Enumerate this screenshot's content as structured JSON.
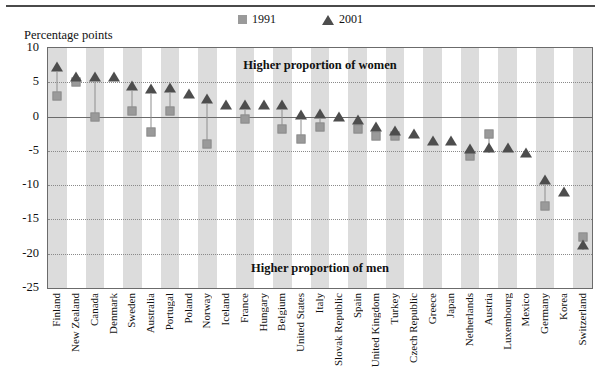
{
  "top_rule": true,
  "axis_title": "Percentage points",
  "legend": [
    {
      "label": "1991",
      "marker": "square-marker",
      "color": "#9a9a9a"
    },
    {
      "label": "2001",
      "marker": "triangle-marker",
      "color": "#4d4d4d"
    }
  ],
  "annotations": {
    "upper": "Higher proportion of women",
    "lower": "Higher proportion of men"
  },
  "chart_data": {
    "type": "scatter",
    "title": "",
    "subtitle": "",
    "xlabel": "",
    "ylabel": "Percentage points",
    "ylim": [
      -25,
      10
    ],
    "yticks": [
      10,
      5,
      0,
      -5,
      -10,
      -15,
      -20,
      -25
    ],
    "ytick_labels": [
      "10",
      "5",
      "0",
      "-5",
      "-10",
      "-15",
      "-20",
      "-25"
    ],
    "grid": true,
    "legend_position": "top-center",
    "annotations": [
      "Higher proportion of women",
      "Higher proportion of men"
    ],
    "categories": [
      "Finland",
      "New Zealand",
      "Canada",
      "Denmark",
      "Sweden",
      "Australia",
      "Portugal",
      "Poland",
      "Norway",
      "Iceland",
      "France",
      "Hungary",
      "Belgium",
      "United States",
      "Italy",
      "Slovak Republic",
      "Spain",
      "United Kingdom",
      "Turkey",
      "Czech Republic",
      "Greece",
      "Japan",
      "Netherlands",
      "Austria",
      "Luxembourg",
      "Mexico",
      "Germany",
      "Korea",
      "Switzerland"
    ],
    "series": [
      {
        "name": "1991",
        "marker": "square",
        "color": "#9a9a9a",
        "values": [
          3.0,
          5.0,
          0.0,
          null,
          0.8,
          -2.2,
          0.8,
          null,
          -4.0,
          null,
          -0.3,
          null,
          -1.8,
          -3.3,
          -1.5,
          null,
          -1.8,
          -2.8,
          -2.8,
          null,
          null,
          null,
          -5.8,
          -2.5,
          null,
          null,
          -13.0,
          null,
          -17.5
        ]
      },
      {
        "name": "2001",
        "marker": "triangle",
        "color": "#4d4d4d",
        "values": [
          6.5,
          5.0,
          5.0,
          5.0,
          3.8,
          3.3,
          3.5,
          2.6,
          1.8,
          1.0,
          1.0,
          1.0,
          1.0,
          -0.5,
          -0.3,
          -0.8,
          -1.3,
          -2.2,
          -2.8,
          -3.3,
          -4.3,
          -4.3,
          -5.5,
          -5.3,
          -5.3,
          -6.0,
          -10.0,
          -11.8,
          -19.5
        ]
      }
    ]
  }
}
